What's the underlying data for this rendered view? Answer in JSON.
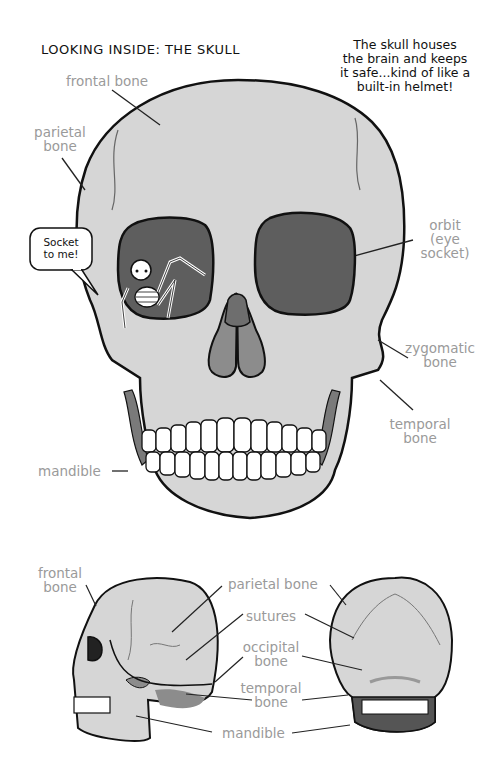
{
  "page": {
    "title": "LOOKING INSIDE: THE SKULL",
    "caption": [
      "The skull houses",
      "the brain and keeps",
      "it safe...kind of like a",
      "built-in helmet!"
    ],
    "speech_bubble": [
      "Socket",
      "to me!"
    ]
  },
  "front_view": {
    "labels": {
      "frontal_bone": "frontal bone",
      "parietal_bone_1": "parietal",
      "parietal_bone_2": "bone",
      "orbit_1": "orbit",
      "orbit_2": "(eye",
      "orbit_3": "socket)",
      "zygomatic_1": "zygomatic",
      "zygomatic_2": "bone",
      "temporal_1": "temporal",
      "temporal_2": "bone",
      "mandible": "mandible"
    }
  },
  "side_back_view": {
    "labels": {
      "frontal_1": "frontal",
      "frontal_2": "bone",
      "parietal": "parietal bone",
      "sutures": "sutures",
      "occipital_1": "occipital",
      "occipital_2": "bone",
      "temporal_1": "temporal",
      "temporal_2": "bone",
      "mandible": "mandible"
    }
  },
  "colors": {
    "bone": "#d6d6d6",
    "outline": "#111111",
    "socket": "#5e5e5e",
    "nasal_upper": "#6e6e6e",
    "nasal_lower": "#8c8c8c",
    "label_gray": "#9a9a9a",
    "teeth": "#ffffff"
  }
}
